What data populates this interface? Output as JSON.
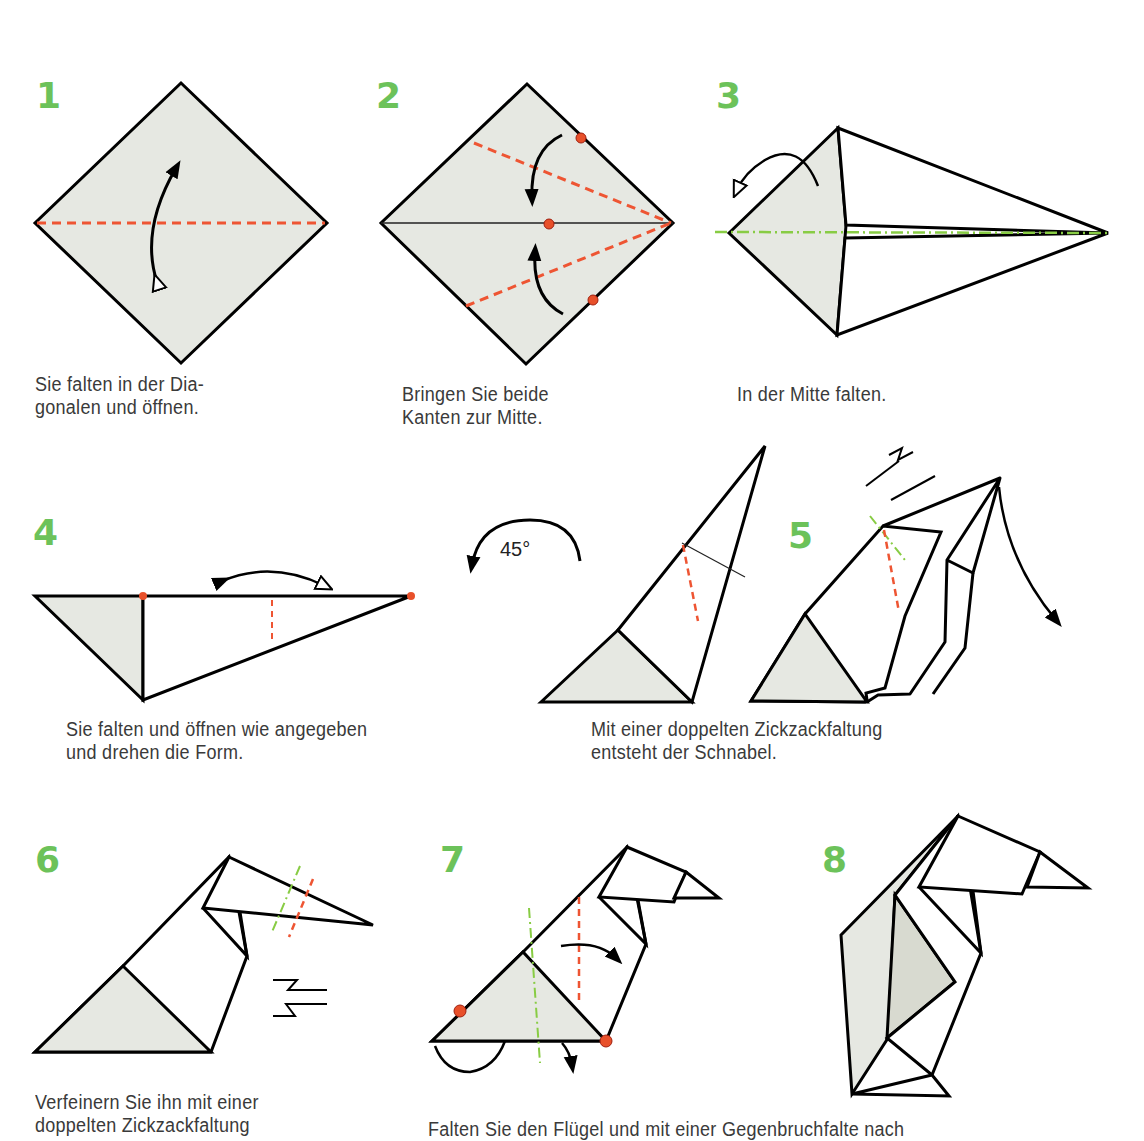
{
  "colors": {
    "step_number": "#6cc25a",
    "paper_fill": "#e6e8e2",
    "valley_fold": "#ee5533",
    "mountain_fold": "#88cc44",
    "reference_dot": "#e8502a",
    "outline": "#000000",
    "caption_text": "#3a3a3a"
  },
  "steps": [
    {
      "number": "1",
      "caption_lines": [
        "Sie falten in der Dia-",
        "gonalen und öffnen."
      ]
    },
    {
      "number": "2",
      "caption_lines": [
        "Bringen Sie beide",
        "Kanten zur Mitte."
      ]
    },
    {
      "number": "3",
      "caption_lines": [
        "In der Mitte falten."
      ]
    },
    {
      "number": "4",
      "caption_lines": [
        "Sie falten und öffnen wie angegeben",
        "und drehen die Form."
      ]
    },
    {
      "number": "5",
      "caption_lines": [
        "Mit einer doppelten Zickzackfaltung",
        "entsteht der Schnabel."
      ]
    },
    {
      "number": "6",
      "caption_lines": [
        "Verfeinern Sie ihn mit einer",
        "doppelten Zickzackfaltung"
      ]
    },
    {
      "number": "7",
      "caption_lines": [
        "Falten Sie den Flügel und mit einer Gegenbruchfalte nach"
      ]
    },
    {
      "number": "8",
      "caption_lines": []
    }
  ],
  "rotation": {
    "label": "45°"
  },
  "legend_icons": [
    "valley-fold-line",
    "mountain-fold-line",
    "reference-dot",
    "fold-arrow",
    "fold-and-unfold-arrow",
    "zigzag-fold-symbol",
    "rotate-arrow"
  ]
}
